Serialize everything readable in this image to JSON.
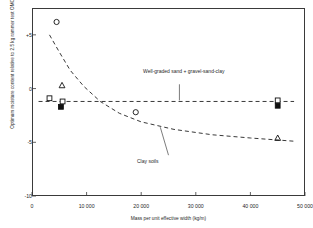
{
  "chart_data": {
    "type": "scatter",
    "title": "",
    "xlabel": "Mass per unit effective width (kg/m)",
    "ylabel": "Optimum moisture content relative to 2.5 kg rammer test OMC: (per cent)",
    "xlim": [
      0,
      50000
    ],
    "ylim": [
      -10,
      7.5
    ],
    "xticks": [
      0,
      10000,
      20000,
      30000,
      40000,
      50000
    ],
    "xticklabels": [
      "0",
      "10 000",
      "20 000",
      "30 000",
      "40 000",
      "50 000"
    ],
    "yticks": [
      5,
      0,
      -5,
      -10
    ],
    "yticklabels": [
      "+5",
      "0",
      "-5",
      "-10"
    ],
    "grid": false,
    "legend_position": "none",
    "annotations": [
      {
        "name": "well-graded-label",
        "text": "Well-graded sand + gravel-sand-clay",
        "x": 27000,
        "y": 1.0
      },
      {
        "name": "clay-soils-label",
        "text": "Clay soils",
        "x": 25000,
        "y": -7.0
      }
    ],
    "series": [
      {
        "name": "Clay soils (open circle)",
        "marker": "open-circle",
        "points": [
          {
            "x": 4500,
            "y": 6.2
          },
          {
            "x": 19000,
            "y": -2.2
          }
        ]
      },
      {
        "name": "Clay soils (open triangle)",
        "marker": "open-triangle",
        "points": [
          {
            "x": 5500,
            "y": 0.3
          },
          {
            "x": 45000,
            "y": -4.6
          }
        ]
      },
      {
        "name": "Well-graded sand (open square)",
        "marker": "open-square",
        "points": [
          {
            "x": 3200,
            "y": -0.9
          },
          {
            "x": 5600,
            "y": -1.2
          },
          {
            "x": 45000,
            "y": -1.1
          }
        ]
      },
      {
        "name": "Gravel-sand-clay (filled square)",
        "marker": "filled-square",
        "points": [
          {
            "x": 5300,
            "y": -1.7
          },
          {
            "x": 45000,
            "y": -1.6
          }
        ]
      }
    ],
    "curves": [
      {
        "name": "clay-soils-curve",
        "style": "dashed",
        "points": [
          {
            "x": 3200,
            "y": 5.0
          },
          {
            "x": 5000,
            "y": 3.4
          },
          {
            "x": 7000,
            "y": 1.7
          },
          {
            "x": 9500,
            "y": 0.2
          },
          {
            "x": 12500,
            "y": -1.2
          },
          {
            "x": 16000,
            "y": -2.3
          },
          {
            "x": 20000,
            "y": -3.1
          },
          {
            "x": 26000,
            "y": -3.8
          },
          {
            "x": 33000,
            "y": -4.3
          },
          {
            "x": 40000,
            "y": -4.6
          },
          {
            "x": 48000,
            "y": -4.9
          }
        ]
      },
      {
        "name": "well-graded-curve",
        "style": "dashed",
        "points": [
          {
            "x": 1200,
            "y": -1.2
          },
          {
            "x": 48000,
            "y": -1.2
          }
        ]
      }
    ],
    "leaders": [
      {
        "name": "well-graded-leader",
        "x1": 27000,
        "y1": 0.4,
        "x2": 27000,
        "y2": -1.1
      },
      {
        "name": "clay-soils-leader",
        "x1": 25000,
        "y1": -6.2,
        "x2": 23500,
        "y2": -3.6
      }
    ]
  }
}
